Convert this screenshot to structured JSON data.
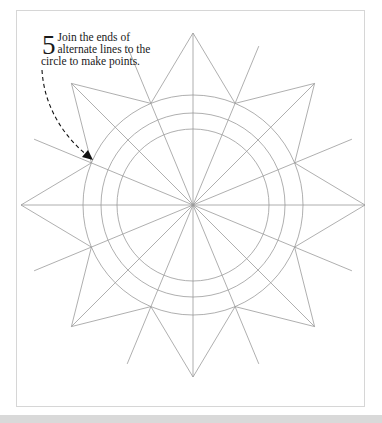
{
  "instruction": {
    "step_number": "5",
    "lines": [
      "Join the ends of",
      "alternate lines to the",
      "circle to make points."
    ]
  },
  "diagram": {
    "center": [
      193,
      205
    ],
    "circle_radii": [
      110,
      92,
      76
    ],
    "long_line_length": 172,
    "radial_line_count": 16,
    "star_point_count": 8,
    "line_color": "#9a9a9a",
    "arrow_color": "#111111"
  },
  "colors": {
    "frame_border": "#d6d6d6",
    "bottom_bar": "#d9d9d9",
    "background": "#ffffff"
  }
}
